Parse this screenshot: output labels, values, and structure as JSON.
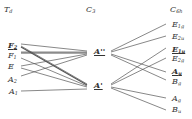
{
  "columns": {
    "left": {
      "title": "T",
      "title_sub": "d"
    },
    "middle": {
      "title": "C",
      "title_sub": "3"
    },
    "right": {
      "title": "C",
      "title_sub": "6h"
    }
  },
  "left_labels": [
    {
      "base": "F",
      "sub": "2",
      "underline": true
    },
    {
      "base": "F",
      "sub": "1",
      "underline": false
    },
    {
      "base": "E",
      "sub": "",
      "underline": false
    },
    {
      "base": "A",
      "sub": "2",
      "underline": false
    },
    {
      "base": "A",
      "sub": "1",
      "underline": false
    }
  ],
  "middle_labels": [
    {
      "base": "A''",
      "sub": "",
      "underline": true
    },
    {
      "base": "A'",
      "sub": "",
      "underline": true
    }
  ],
  "right_labels": [
    {
      "base": "E",
      "sub": "1g",
      "underline": false
    },
    {
      "base": "E",
      "sub": "2u",
      "underline": false
    },
    {
      "base": "E",
      "sub": "1u",
      "underline": true
    },
    {
      "base": "E",
      "sub": "2g",
      "underline": false
    },
    {
      "base": "A",
      "sub": "u",
      "underline": true
    },
    {
      "base": "B",
      "sub": "g",
      "underline": false
    },
    {
      "base": "A",
      "sub": "g",
      "underline": false
    },
    {
      "base": "B",
      "sub": "u",
      "underline": false
    }
  ],
  "line_color": "#555555"
}
